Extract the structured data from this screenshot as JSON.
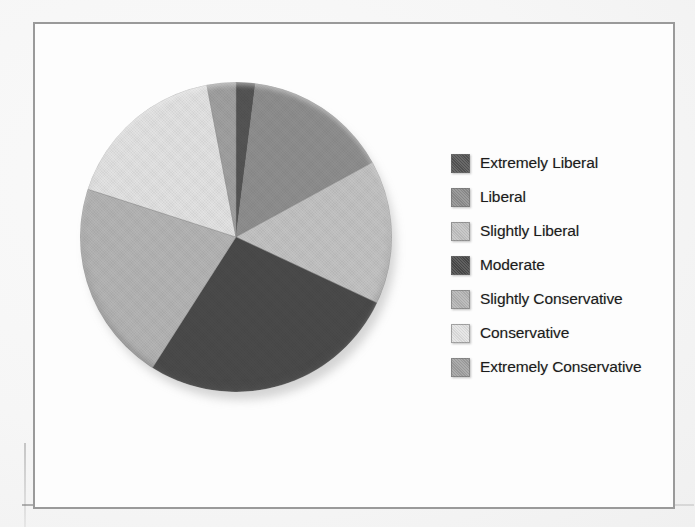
{
  "document": {
    "kind": "scanned-page-figure",
    "frame_border_color": "#9a9a9a",
    "background_color": "#fbfbfb"
  },
  "legend": {
    "position": "right",
    "entries": [
      {
        "label": "Extremely Liberal",
        "color": "#545454"
      },
      {
        "label": "Liberal",
        "color": "#8e8e8e"
      },
      {
        "label": "Slightly Liberal",
        "color": "#c2c2c2"
      },
      {
        "label": "Moderate",
        "color": "#4a4a4a"
      },
      {
        "label": "Slightly Conservative",
        "color": "#b4b4b4"
      },
      {
        "label": "Conservative",
        "color": "#e2e2e2"
      },
      {
        "label": "Extremely Conservative",
        "color": "#a0a0a0"
      }
    ]
  },
  "chart_data": {
    "type": "pie",
    "title": "",
    "subtitle": "",
    "xlabel": "",
    "ylabel": "",
    "grid": false,
    "legend_position": "right",
    "start_angle_deg": 0,
    "direction": "clockwise",
    "categories": [
      "Extremely Liberal",
      "Liberal",
      "Slightly Liberal",
      "Moderate",
      "Slightly Conservative",
      "Conservative",
      "Extremely Conservative"
    ],
    "values": [
      2,
      15,
      15,
      27,
      21,
      17,
      3
    ],
    "angles_deg": [
      7.2,
      54,
      54,
      97.2,
      75.6,
      61.2,
      10.8
    ],
    "colors": [
      "#545454",
      "#8e8e8e",
      "#c2c2c2",
      "#4a4a4a",
      "#b4b4b4",
      "#e2e2e2",
      "#a0a0a0"
    ],
    "annotations": []
  }
}
